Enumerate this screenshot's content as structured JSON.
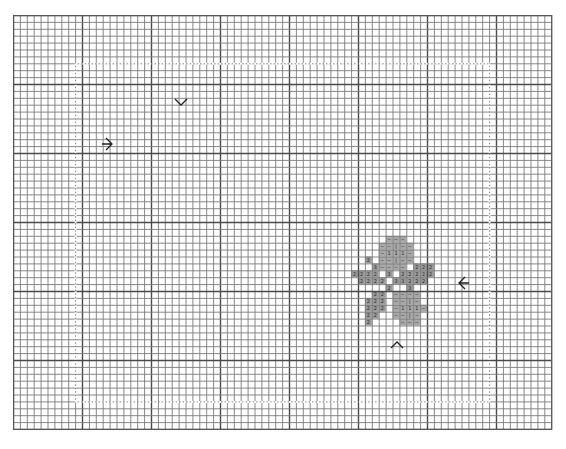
{
  "chart_title": "Cross-stitch pattern chart",
  "grid": {
    "origin_x": 13,
    "origin_y": 15,
    "cols": 78,
    "rows": 60,
    "cell": 6.9,
    "line_color": "#7a7a7a",
    "major_line_color": "#4a4a4a",
    "major_every": 10,
    "border_color": "#555555"
  },
  "guides": {
    "color": "#ffffff",
    "left_col": 9,
    "right_col": 69,
    "top_row": 7,
    "bottom_row": 56
  },
  "center_markers": [
    {
      "name": "top-center-marker",
      "glyph": "v",
      "x": 181,
      "y": 102
    },
    {
      "name": "left-center-marker",
      "glyph": ">",
      "x": 109,
      "y": 144
    },
    {
      "name": "right-center-marker",
      "glyph": "<",
      "x": 462,
      "y": 283
    },
    {
      "name": "bottom-center-marker",
      "glyph": "^",
      "x": 397,
      "y": 345
    }
  ],
  "legend": [
    {
      "symbol": "2",
      "color": "#9a9a9a"
    },
    {
      "symbol": "3",
      "color": "#9a9a9a"
    },
    {
      "symbol": "-",
      "color": "#a8a8a8"
    },
    {
      "symbol": "|",
      "color": "#a8a8a8"
    },
    {
      "symbol": "1",
      "color": "#a8a8a8"
    }
  ],
  "stitches": [
    {
      "c": 54,
      "r": 32,
      "s": "-"
    },
    {
      "c": 55,
      "r": 32,
      "s": "-"
    },
    {
      "c": 56,
      "r": 32,
      "s": "-"
    },
    {
      "c": 53,
      "r": 33,
      "s": "-"
    },
    {
      "c": 54,
      "r": 33,
      "s": "-"
    },
    {
      "c": 55,
      "r": 33,
      "s": "|"
    },
    {
      "c": 56,
      "r": 33,
      "s": "-"
    },
    {
      "c": 57,
      "r": 33,
      "s": "-"
    },
    {
      "c": 53,
      "r": 34,
      "s": "-"
    },
    {
      "c": 54,
      "r": 34,
      "s": "1"
    },
    {
      "c": 55,
      "r": 34,
      "s": "1"
    },
    {
      "c": 56,
      "r": 34,
      "s": "1"
    },
    {
      "c": 57,
      "r": 34,
      "s": "-"
    },
    {
      "c": 51,
      "r": 35,
      "s": "2"
    },
    {
      "c": 53,
      "r": 35,
      "s": "-"
    },
    {
      "c": 54,
      "r": 35,
      "s": "-"
    },
    {
      "c": 55,
      "r": 35,
      "s": "|"
    },
    {
      "c": 56,
      "r": 35,
      "s": "-"
    },
    {
      "c": 57,
      "r": 35,
      "s": "-"
    },
    {
      "c": 52,
      "r": 36,
      "s": "3"
    },
    {
      "c": 53,
      "r": 36,
      "s": "-"
    },
    {
      "c": 54,
      "r": 36,
      "s": "-"
    },
    {
      "c": 55,
      "r": 36,
      "s": "-"
    },
    {
      "c": 56,
      "r": 36,
      "s": "-"
    },
    {
      "c": 58,
      "r": 36,
      "s": "2"
    },
    {
      "c": 59,
      "r": 36,
      "s": "2"
    },
    {
      "c": 60,
      "r": 36,
      "s": "2"
    },
    {
      "c": 49,
      "r": 37,
      "s": "2"
    },
    {
      "c": 50,
      "r": 37,
      "s": "2"
    },
    {
      "c": 51,
      "r": 37,
      "s": "2"
    },
    {
      "c": 52,
      "r": 37,
      "s": "2"
    },
    {
      "c": 54,
      "r": 37,
      "s": "3"
    },
    {
      "c": 56,
      "r": 37,
      "s": "2"
    },
    {
      "c": 57,
      "r": 37,
      "s": "2"
    },
    {
      "c": 58,
      "r": 37,
      "s": "2"
    },
    {
      "c": 59,
      "r": 37,
      "s": "2"
    },
    {
      "c": 60,
      "r": 37,
      "s": "2"
    },
    {
      "c": 50,
      "r": 38,
      "s": "2"
    },
    {
      "c": 51,
      "r": 38,
      "s": "2"
    },
    {
      "c": 52,
      "r": 38,
      "s": "2"
    },
    {
      "c": 53,
      "r": 38,
      "s": "2"
    },
    {
      "c": 55,
      "r": 38,
      "s": "3"
    },
    {
      "c": 56,
      "r": 38,
      "s": "3"
    },
    {
      "c": 57,
      "r": 38,
      "s": "2"
    },
    {
      "c": 58,
      "r": 38,
      "s": "2"
    },
    {
      "c": 59,
      "r": 38,
      "s": "2"
    },
    {
      "c": 54,
      "r": 39,
      "s": "2"
    },
    {
      "c": 57,
      "r": 39,
      "s": "3"
    },
    {
      "c": 52,
      "r": 40,
      "s": "2"
    },
    {
      "c": 53,
      "r": 40,
      "s": "2"
    },
    {
      "c": 55,
      "r": 40,
      "s": "-"
    },
    {
      "c": 56,
      "r": 40,
      "s": "-"
    },
    {
      "c": 57,
      "r": 40,
      "s": "-"
    },
    {
      "c": 58,
      "r": 40,
      "s": "-"
    },
    {
      "c": 51,
      "r": 41,
      "s": "2"
    },
    {
      "c": 52,
      "r": 41,
      "s": "2"
    },
    {
      "c": 53,
      "r": 41,
      "s": "2"
    },
    {
      "c": 55,
      "r": 41,
      "s": "-"
    },
    {
      "c": 56,
      "r": 41,
      "s": "-"
    },
    {
      "c": 57,
      "r": 41,
      "s": "|"
    },
    {
      "c": 58,
      "r": 41,
      "s": "-"
    },
    {
      "c": 51,
      "r": 42,
      "s": "2"
    },
    {
      "c": 52,
      "r": 42,
      "s": "2"
    },
    {
      "c": 53,
      "r": 42,
      "s": "2"
    },
    {
      "c": 55,
      "r": 42,
      "s": "-"
    },
    {
      "c": 56,
      "r": 42,
      "s": "1"
    },
    {
      "c": 57,
      "r": 42,
      "s": "1"
    },
    {
      "c": 58,
      "r": 42,
      "s": "1"
    },
    {
      "c": 59,
      "r": 42,
      "s": "-"
    },
    {
      "c": 51,
      "r": 43,
      "s": "2"
    },
    {
      "c": 52,
      "r": 43,
      "s": "2"
    },
    {
      "c": 55,
      "r": 43,
      "s": "-"
    },
    {
      "c": 56,
      "r": 43,
      "s": "-"
    },
    {
      "c": 57,
      "r": 43,
      "s": "|"
    },
    {
      "c": 58,
      "r": 43,
      "s": "-"
    },
    {
      "c": 51,
      "r": 44,
      "s": "2"
    },
    {
      "c": 56,
      "r": 44,
      "s": "-"
    },
    {
      "c": 57,
      "r": 44,
      "s": "-"
    },
    {
      "c": 58,
      "r": 44,
      "s": "-"
    }
  ]
}
